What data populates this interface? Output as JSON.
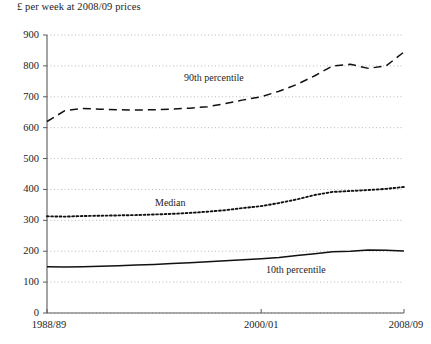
{
  "chart_data": {
    "type": "line",
    "title": "£ per week at 2008/09 prices",
    "xlabel": "",
    "ylabel": "",
    "ylim": [
      0,
      900
    ],
    "ytick_step": 100,
    "yticks": [
      "0",
      "100",
      "200",
      "300",
      "400",
      "500",
      "600",
      "700",
      "800",
      "900"
    ],
    "grid": "horizontal-dotted",
    "legend": "inline-annotations",
    "x": [
      "1988/89",
      "1989/90",
      "1990/91",
      "1991/92",
      "1992/93",
      "1993/94",
      "1994/95",
      "1995/96",
      "1996/97",
      "1997/98",
      "1998/99",
      "1999/00",
      "2000/01",
      "2001/02",
      "2002/03",
      "2003/04",
      "2004/05",
      "2005/06",
      "2006/07",
      "2007/08",
      "2008/09"
    ],
    "xticks": [
      {
        "label": "1988/89",
        "index": 0
      },
      {
        "label": "2000/01",
        "index": 12
      },
      {
        "label": "2008/09",
        "index": 20
      }
    ],
    "series": [
      {
        "name": "90th percentile",
        "style": "dashed",
        "values": [
          620,
          655,
          662,
          660,
          658,
          657,
          658,
          660,
          663,
          668,
          678,
          690,
          700,
          718,
          740,
          768,
          800,
          805,
          792,
          800,
          845
        ]
      },
      {
        "name": "Median",
        "style": "dotted",
        "values": [
          313,
          312,
          314,
          315,
          316,
          317,
          319,
          321,
          324,
          328,
          333,
          340,
          346,
          356,
          368,
          382,
          392,
          395,
          398,
          402,
          408
        ]
      },
      {
        "name": "10th percentile",
        "style": "solid",
        "values": [
          150,
          149,
          150,
          151,
          153,
          155,
          157,
          160,
          163,
          166,
          169,
          172,
          176,
          180,
          186,
          192,
          198,
          200,
          204,
          203,
          201
        ]
      }
    ],
    "annotations": [
      {
        "text": "90th percentile",
        "x_px": 184,
        "y_px": 73
      },
      {
        "text": "Median",
        "x_px": 155,
        "y_px": 198
      },
      {
        "text": "10th percentile",
        "x_px": 266,
        "y_px": 265
      }
    ]
  }
}
